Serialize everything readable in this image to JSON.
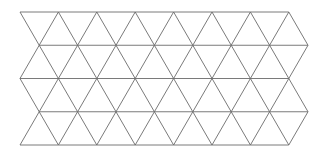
{
  "figure": {
    "name": "triangular-lattice",
    "background_color": "#ffffff",
    "width": 318,
    "height": 156
  },
  "lattice": {
    "type": "triangular-grid",
    "stroke_color": "#6b6b6b",
    "stroke_width": 0.9,
    "origin_x": 20,
    "origin_y": 12,
    "row_height": 33.25,
    "column_pitch": 38.4,
    "rows": 4,
    "columns": 7,
    "row_offsets": [
      0,
      0.5,
      0,
      0.5,
      0
    ],
    "horizontal_line_y": [
      12,
      45.25,
      78.5,
      111.75,
      145
    ],
    "left_edge_x": 20,
    "right_edge_x": 296,
    "bottom_edge_y": 145
  }
}
